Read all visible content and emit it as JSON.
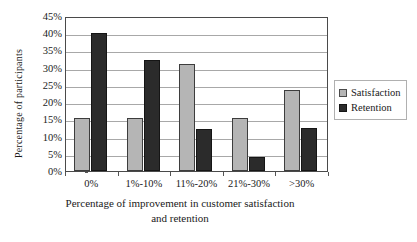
{
  "chart_data": {
    "type": "bar",
    "title": "",
    "xlabel": "Percentage of improvement in customer satisfaction and retention",
    "xlabel_line1": "Percentage of improvement in customer satisfaction",
    "xlabel_line2": "and retention",
    "ylabel": "Percentage of participants",
    "categories": [
      "0%",
      "1%-10%",
      "11%-20%",
      "21%-30%",
      ">30%"
    ],
    "ylim": [
      0,
      45
    ],
    "ytick_values": [
      0,
      5,
      10,
      15,
      20,
      25,
      30,
      35,
      40,
      45
    ],
    "ytick_labels": [
      "0%",
      "5%",
      "10%",
      "15%",
      "20%",
      "25%",
      "30%",
      "35%",
      "40%",
      "45%"
    ],
    "grid": true,
    "grid_axis": "y",
    "legend_position": "right",
    "series": [
      {
        "name": "Satisfaction",
        "color": "#b5b5b5",
        "values": [
          15.5,
          15.5,
          31.0,
          15.5,
          23.5
        ]
      },
      {
        "name": "Retention",
        "color": "#2b2b2b",
        "values": [
          40.0,
          32.3,
          12.3,
          4.0,
          12.5
        ]
      }
    ]
  },
  "legend": {
    "items": [
      {
        "label": "Satisfaction",
        "swatch": "satisfaction"
      },
      {
        "label": "Retention",
        "swatch": "retention"
      }
    ]
  }
}
